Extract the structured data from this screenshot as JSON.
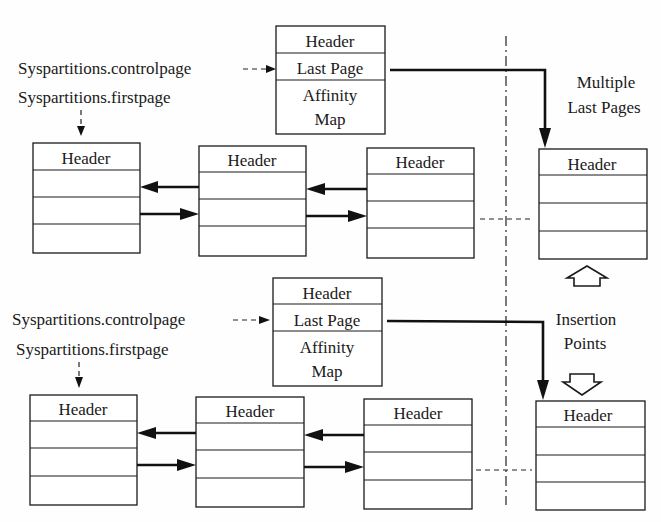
{
  "diagram": {
    "colors": {
      "ink": "#1a1a1a",
      "paper": "#fefefe"
    },
    "groups": [
      {
        "id": "top",
        "controlpage_label": "Syspartitions.controlpage",
        "firstpage_label": "Syspartitions.firstpage",
        "control_page": {
          "rows": [
            "Header",
            "Last Page",
            "Affinity",
            "Map"
          ]
        },
        "pages": [
          {
            "header": "Header"
          },
          {
            "header": "Header"
          },
          {
            "header": "Header"
          }
        ],
        "last_page": {
          "header": "Header"
        }
      },
      {
        "id": "bottom",
        "controlpage_label": "Syspartitions.controlpage",
        "firstpage_label": "Syspartitions.firstpage",
        "control_page": {
          "rows": [
            "Header",
            "Last Page",
            "Affinity",
            "Map"
          ]
        },
        "pages": [
          {
            "header": "Header"
          },
          {
            "header": "Header"
          },
          {
            "header": "Header"
          }
        ],
        "last_page": {
          "header": "Header"
        }
      }
    ],
    "annotations": {
      "multiple_last_pages": [
        "Multiple",
        "Last Pages"
      ],
      "insertion_points": [
        "Insertion",
        "Points"
      ]
    }
  }
}
